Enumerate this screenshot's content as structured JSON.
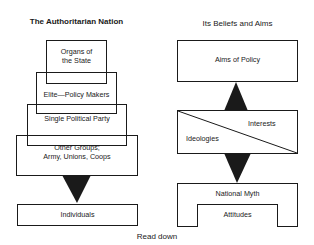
{
  "left": {
    "title": "The Authoritarian Nation",
    "levels": [
      {
        "label_line1": "Organs of",
        "label_line2": "the State"
      },
      {
        "label": "Elite—Policy Makers"
      },
      {
        "label": "Single Political Party"
      },
      {
        "label_line1": "Other Groups;",
        "label_line2": "Army, Unions, Coops"
      }
    ],
    "base": {
      "label": "Individuals"
    }
  },
  "right": {
    "title": "Its Beliefs and Aims",
    "top": {
      "label": "Aims of Policy"
    },
    "middle": {
      "left_label": "Ideologies",
      "right_label": "Interests"
    },
    "bottom": {
      "label": "National Myth",
      "inner_label": "Attitudes"
    }
  },
  "footer": {
    "caption": "Read down"
  },
  "colors": {
    "ink": "#1a1a1a",
    "background": "#ffffff"
  }
}
